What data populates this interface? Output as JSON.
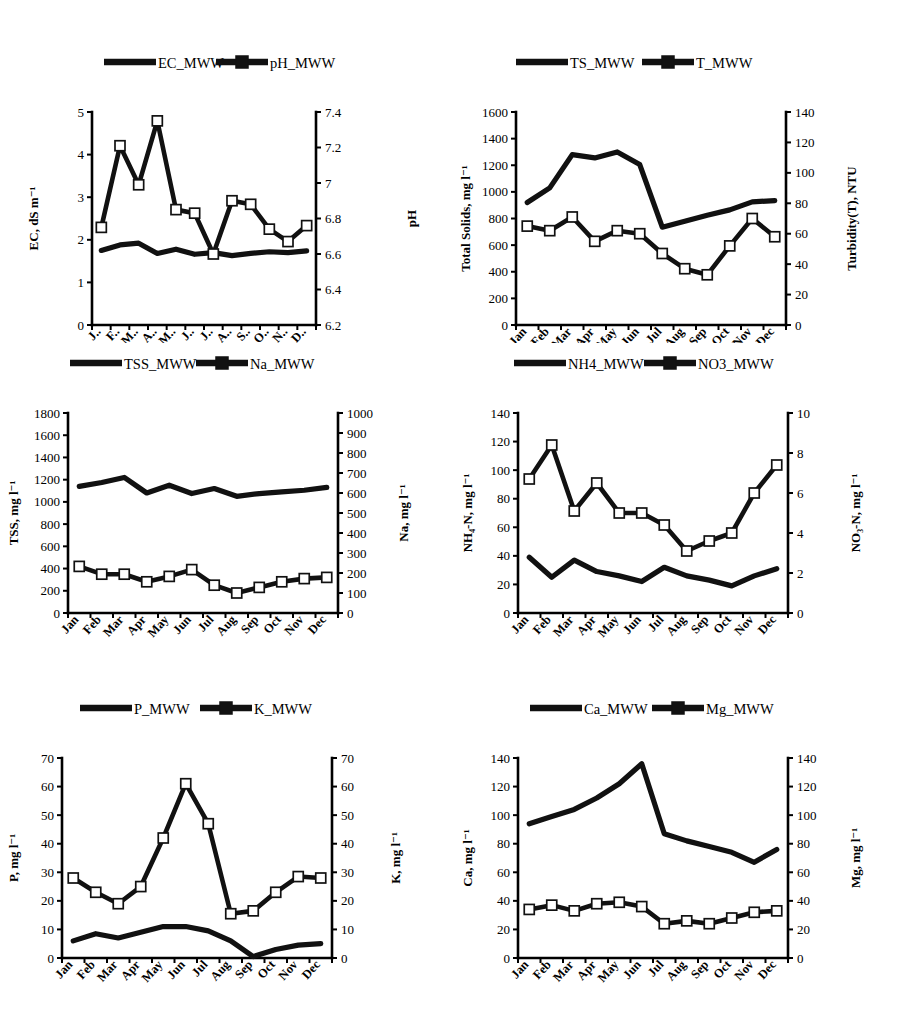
{
  "figure": {
    "months_full": [
      "Jan",
      "Feb",
      "Mar",
      "Apr",
      "May",
      "Jun",
      "Jul",
      "Aug",
      "Sep",
      "Oct",
      "Nov",
      "Dec"
    ],
    "months_truncated": [
      "J..",
      "F..",
      "M..",
      "A..",
      "M..",
      "J..",
      "J..",
      "A..",
      "S..",
      "O..",
      "N..",
      "D.."
    ],
    "line_color": "#111111",
    "marker_fill": "#ffffff"
  },
  "chart_data": [
    {
      "id": "ec-ph",
      "type": "line",
      "title": "",
      "xlabel": "",
      "categories": [
        "J..",
        "F..",
        "M..",
        "A..",
        "M..",
        "J..",
        "J..",
        "A..",
        "S..",
        "O..",
        "N..",
        "D.."
      ],
      "ylabel": "EC, dS m⁻¹",
      "ylim": [
        0,
        5
      ],
      "yticks": [
        0,
        1,
        2,
        3,
        4,
        5
      ],
      "y2label": "pH",
      "y2lim": [
        6.2,
        7.4
      ],
      "y2ticks": [
        6.2,
        6.4,
        6.6,
        6.8,
        7,
        7.2,
        7.4
      ],
      "y2ticklabels": [
        "6.2",
        "6.4",
        "6.6",
        "6.8",
        "7",
        "7.2",
        "7.4"
      ],
      "legend_position": "top",
      "grid": false,
      "series": [
        {
          "name": "EC_MWW",
          "axis": "left",
          "marker": "none",
          "values": [
            1.75,
            1.88,
            1.92,
            1.68,
            1.78,
            1.66,
            1.7,
            1.63,
            1.68,
            1.72,
            1.7,
            1.74
          ]
        },
        {
          "name": "pH_MWW",
          "axis": "right",
          "marker": "square",
          "values": [
            6.75,
            7.21,
            6.99,
            7.35,
            6.85,
            6.83,
            6.6,
            6.9,
            6.88,
            6.74,
            6.67,
            6.76
          ]
        }
      ]
    },
    {
      "id": "ts-turbidity",
      "type": "line",
      "title": "",
      "xlabel": "",
      "categories": [
        "Jan",
        "Feb",
        "Mar",
        "Apr",
        "May",
        "Jun",
        "Jul",
        "Aug",
        "Sep",
        "Oct",
        "Nov",
        "Dec"
      ],
      "ylabel": "Total Solids, mg l⁻¹",
      "ylim": [
        0,
        1600
      ],
      "yticks": [
        0,
        200,
        400,
        600,
        800,
        1000,
        1200,
        1400,
        1600
      ],
      "y2label": "Turbidity(T), NTU",
      "y2lim": [
        0,
        140
      ],
      "y2ticks": [
        0,
        20,
        40,
        60,
        80,
        100,
        120,
        140
      ],
      "legend_position": "top",
      "grid": false,
      "series": [
        {
          "name": "TS_MWW",
          "axis": "left",
          "marker": "none",
          "values": [
            920,
            1030,
            1280,
            1255,
            1300,
            1205,
            735,
            780,
            825,
            865,
            925,
            935
          ]
        },
        {
          "name": "T_MWW",
          "axis": "right",
          "marker": "square",
          "values": [
            65,
            62,
            71,
            55,
            62,
            60,
            47,
            37,
            33,
            52,
            70,
            58
          ]
        }
      ]
    },
    {
      "id": "tss-na",
      "type": "line",
      "title": "",
      "xlabel": "",
      "categories": [
        "Jan",
        "Feb",
        "Mar",
        "Apr",
        "May",
        "Jun",
        "Jul",
        "Aug",
        "Sep",
        "Oct",
        "Nov",
        "Dec"
      ],
      "ylabel": "TSS, mg l⁻¹",
      "ylim": [
        0,
        1800
      ],
      "yticks": [
        0,
        200,
        400,
        600,
        800,
        1000,
        1200,
        1400,
        1600,
        1800
      ],
      "y2label": "Na, mg l⁻¹",
      "y2lim": [
        0,
        1000
      ],
      "y2ticks": [
        0,
        100,
        200,
        300,
        400,
        500,
        600,
        700,
        800,
        900,
        1000
      ],
      "legend_position": "top",
      "grid": false,
      "series": [
        {
          "name": "TSS_MWW",
          "axis": "left",
          "marker": "none",
          "values": [
            1140,
            1175,
            1220,
            1080,
            1150,
            1075,
            1120,
            1050,
            1075,
            1090,
            1105,
            1130
          ]
        },
        {
          "name": "Na_MWW",
          "axis": "right",
          "marker": "square",
          "values": [
            233,
            194,
            194,
            156,
            183,
            217,
            139,
            100,
            128,
            156,
            172,
            178
          ]
        }
      ]
    },
    {
      "id": "nh4-no3",
      "type": "line",
      "title": "",
      "xlabel": "",
      "categories": [
        "Jan",
        "Feb",
        "Mar",
        "Apr",
        "May",
        "Jun",
        "Jul",
        "Aug",
        "Sep",
        "Oct",
        "Nov",
        "Dec"
      ],
      "ylabel": "NH₄-N, mg l⁻¹",
      "ylim": [
        0,
        140
      ],
      "yticks": [
        0,
        20,
        40,
        60,
        80,
        100,
        120,
        140
      ],
      "y2label": "NO₃-N, mg l⁻¹",
      "y2lim": [
        0,
        10
      ],
      "y2ticks": [
        0,
        2,
        4,
        6,
        8,
        10
      ],
      "legend_position": "top",
      "grid": false,
      "series": [
        {
          "name": "NH4_MWW",
          "axis": "left",
          "marker": "none",
          "values": [
            39,
            25,
            37,
            29,
            26,
            22,
            32,
            26,
            23,
            19,
            26,
            31
          ]
        },
        {
          "name": "NO3_MWW",
          "axis": "right",
          "marker": "square",
          "values": [
            6.7,
            8.4,
            5.1,
            6.5,
            5.0,
            5.0,
            4.4,
            3.1,
            3.6,
            4.0,
            6.0,
            7.4
          ]
        }
      ]
    },
    {
      "id": "p-k",
      "type": "line",
      "title": "",
      "xlabel": "",
      "categories": [
        "Jan",
        "Feb",
        "Mar",
        "Apr",
        "May",
        "Jun",
        "Jul",
        "Aug",
        "Sep",
        "Oct",
        "Nov",
        "Dec"
      ],
      "ylabel": "P, mg l⁻¹",
      "ylim": [
        0,
        70
      ],
      "yticks": [
        0,
        10,
        20,
        30,
        40,
        50,
        60,
        70
      ],
      "y2label": "K, mg l⁻¹",
      "y2lim": [
        0,
        70
      ],
      "y2ticks": [
        0,
        10,
        20,
        30,
        40,
        50,
        60,
        70
      ],
      "legend_position": "top",
      "grid": false,
      "series": [
        {
          "name": "P_MWW",
          "axis": "left",
          "marker": "none",
          "values": [
            6.0,
            8.5,
            7.0,
            9.0,
            11.0,
            11.0,
            9.5,
            6.0,
            0.5,
            3.0,
            4.5,
            5.0
          ]
        },
        {
          "name": "K_MWW",
          "axis": "right",
          "marker": "square",
          "values": [
            28.0,
            23.0,
            19.0,
            25.0,
            42.0,
            61.0,
            47.0,
            15.5,
            16.5,
            23.0,
            28.5,
            28.0
          ]
        }
      ]
    },
    {
      "id": "ca-mg",
      "type": "line",
      "title": "",
      "xlabel": "",
      "categories": [
        "Jan",
        "Feb",
        "Mar",
        "Apr",
        "May",
        "Jun",
        "Jul",
        "Aug",
        "Sep",
        "Oct",
        "Nov",
        "Dec"
      ],
      "ylabel": "Ca, mg l⁻¹",
      "ylim": [
        0,
        140
      ],
      "yticks": [
        0,
        20,
        40,
        60,
        80,
        100,
        120,
        140
      ],
      "y2label": "Mg, mg l⁻¹",
      "y2lim": [
        0,
        140
      ],
      "y2ticks": [
        0,
        20,
        40,
        60,
        80,
        100,
        120,
        140
      ],
      "legend_position": "top",
      "grid": false,
      "series": [
        {
          "name": "Ca_MWW",
          "axis": "left",
          "marker": "none",
          "values": [
            94,
            99,
            104,
            112,
            122,
            136,
            87,
            82,
            78,
            74,
            67,
            76
          ]
        },
        {
          "name": "Mg_MWW",
          "axis": "right",
          "marker": "square",
          "values": [
            34,
            37,
            33,
            38,
            39,
            36,
            24,
            26,
            24,
            28,
            32,
            33
          ]
        }
      ]
    }
  ]
}
